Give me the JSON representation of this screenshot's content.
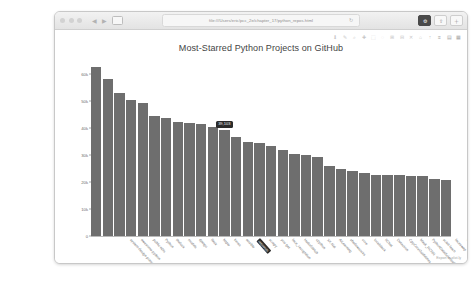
{
  "browser": {
    "url": "file:///Users/eric/pcc_2e/chapter_17/python_repos.html",
    "reload_icon": "reload-icon",
    "back_icon": "chevron-left-icon",
    "forward_icon": "chevron-right-icon",
    "sidebar_icon": "sidebar-icon",
    "right_buttons": [
      {
        "name": "extension-button",
        "glyph": "⚙"
      },
      {
        "name": "share-button",
        "glyph": "⇧"
      },
      {
        "name": "new-tab-button",
        "glyph": "＋"
      }
    ],
    "traffic_lights": [
      "close-button",
      "minimize-button",
      "maximize-button"
    ]
  },
  "modebar": {
    "items": [
      {
        "name": "download-plot-icon",
        "glyph": "⬇"
      },
      {
        "name": "edit-in-chart-studio-icon",
        "glyph": "✎"
      },
      {
        "name": "zoom-icon",
        "glyph": "⌕"
      },
      {
        "name": "pan-icon",
        "glyph": "✚"
      },
      {
        "name": "box-select-icon",
        "glyph": "⬚"
      },
      {
        "name": "lasso-select-icon",
        "glyph": "◌"
      },
      {
        "name": "zoom-in-icon",
        "glyph": "⊞"
      },
      {
        "name": "zoom-out-icon",
        "glyph": "⊟"
      },
      {
        "name": "autoscale-icon",
        "glyph": "✕"
      },
      {
        "name": "reset-axes-icon",
        "glyph": "⌂"
      },
      {
        "name": "toggle-spike-lines-icon",
        "glyph": "↑"
      },
      {
        "name": "hover-compare-icon",
        "glyph": "≡"
      },
      {
        "name": "hover-closest-icon",
        "glyph": "▤"
      },
      {
        "name": "plotly-logo-icon",
        "glyph": "▦"
      }
    ]
  },
  "export_link": "Export to plot.ly",
  "chart_data": {
    "type": "bar",
    "title": "Most-Starred Python Projects on GitHub",
    "xlabel": "Repository",
    "ylabel": "Stars",
    "ylim": [
      0,
      65000
    ],
    "yticks": [
      0,
      10000,
      20000,
      30000,
      40000,
      50000,
      60000
    ],
    "ytick_labels": [
      "0",
      "10k",
      "20k",
      "30k",
      "40k",
      "50k",
      "60k"
    ],
    "grid": false,
    "legend": "none",
    "bar_color": "#6e6e6e",
    "categories": [
      "system-design-primer",
      "awesome-python",
      "public-apis",
      "Python",
      "thefuck",
      "models",
      "django",
      "flask",
      "httpie",
      "keras",
      "ansible",
      "requests",
      "scrapy",
      "you-get",
      "face_recognition",
      "HelloGitHub",
      "cpython",
      "XX-Net",
      "AiLearning",
      "shadowsocks",
      "core",
      "localstack",
      "ItChat",
      "Detectron",
      "CppCoreGuidelines",
      "Mask_RCNN",
      "PythonDataScienceHandbook",
      "scikit-learn",
      "faceswap",
      "certbot",
      "Deep-Learning-Papers-Reading-Roadmap"
    ],
    "values": [
      62500,
      57900,
      53000,
      50200,
      49300,
      44200,
      43500,
      42000,
      41900,
      41300,
      40300,
      39100,
      36600,
      34800,
      34400,
      33100,
      31700,
      30200,
      29900,
      29100,
      25900,
      24600,
      23900,
      23100,
      22700,
      22500,
      22400,
      22300,
      22200,
      20900,
      20700
    ],
    "selected_index": 11,
    "tooltip": {
      "text": "39,103",
      "category_label": "requests"
    }
  }
}
